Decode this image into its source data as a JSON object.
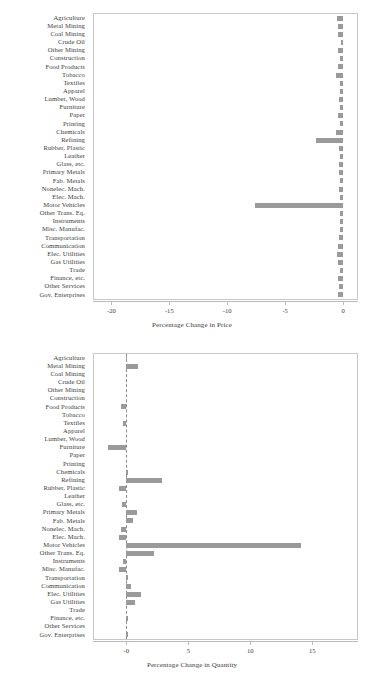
{
  "figure": {
    "panels": [
      {
        "id": "price",
        "axis_title": "Percentage Change in Price"
      },
      {
        "id": "quantity",
        "axis_title": "Percentage Change in Quantity"
      }
    ]
  },
  "categories": [
    "Agriculture",
    "Metal Mining",
    "Coal Mining",
    "Crude Oil",
    "Other Mining",
    "Construction",
    "Food Products",
    "Tobacco",
    "Textiles",
    "Apparel",
    "Lumber, Wood",
    "Furniture",
    "Paper",
    "Printing",
    "Chemicals",
    "Refining",
    "Rubber, Plastic",
    "Leather",
    "Glass, etc.",
    "Primary Metals",
    "Fab. Metals",
    "Nonelec. Mach.",
    "Elec. Mach.",
    "Motor Vehicles",
    "Other Trans. Eq.",
    "Instruments",
    "Misc. Manufac.",
    "Transportation",
    "Communication",
    "Elec. Utilities",
    "Gas Utilities",
    "Trade",
    "Finance, etc.",
    "Other Services",
    "Gov. Enterprises"
  ],
  "colors": {
    "bar": "#9a9a9a",
    "frame": "#c8c8cc",
    "text": "#3c3c3c",
    "zero_line": "#8c8c8c"
  },
  "chart_data": [
    {
      "type": "bar",
      "orientation": "horizontal",
      "id": "price",
      "title": "",
      "xlabel": "Percentage Change in Price",
      "ylabel": "",
      "xlim": [
        -21.5,
        1.2
      ],
      "xticks": [
        -20,
        -15,
        -10,
        -5,
        0
      ],
      "xticklabels": [
        "-20",
        "-15",
        "-10",
        "-5",
        "0"
      ],
      "grid": false,
      "legend": "none",
      "categories": [
        "Agriculture",
        "Metal Mining",
        "Coal Mining",
        "Crude Oil",
        "Other Mining",
        "Construction",
        "Food Products",
        "Tobacco",
        "Textiles",
        "Apparel",
        "Lumber, Wood",
        "Furniture",
        "Paper",
        "Printing",
        "Chemicals",
        "Refining",
        "Rubber, Plastic",
        "Leather",
        "Glass, etc.",
        "Primary Metals",
        "Fab. Metals",
        "Nonelec. Mach.",
        "Elec. Mach.",
        "Motor Vehicles",
        "Other Trans. Eq.",
        "Instruments",
        "Misc. Manufac.",
        "Transportation",
        "Communication",
        "Elec. Utilities",
        "Gas Utilities",
        "Trade",
        "Finance, etc.",
        "Other Services",
        "Gov. Enterprises"
      ],
      "values": [
        -0.55,
        -0.4,
        -0.4,
        -0.22,
        -0.4,
        -0.3,
        -0.45,
        -0.65,
        -0.3,
        -0.28,
        -0.38,
        -0.3,
        -0.4,
        -0.3,
        -0.6,
        -2.35,
        -0.35,
        -0.28,
        -0.35,
        -0.35,
        -0.3,
        -0.32,
        -0.28,
        -7.6,
        -0.28,
        -0.28,
        -0.28,
        -0.38,
        -0.45,
        -0.55,
        -0.45,
        -0.3,
        -0.4,
        -0.35,
        -0.4
      ]
    },
    {
      "type": "bar",
      "orientation": "horizontal",
      "id": "quantity",
      "title": "",
      "xlabel": "Percentage Change in Quantity",
      "ylabel": "",
      "xlim": [
        -2.6,
        18.6
      ],
      "xticks": [
        0,
        5,
        10,
        15
      ],
      "xticklabels": [
        "-0",
        "5",
        "10",
        "15"
      ],
      "grid": false,
      "zero_line": true,
      "legend": "none",
      "categories": [
        "Agriculture",
        "Metal Mining",
        "Coal Mining",
        "Crude Oil",
        "Other Mining",
        "Construction",
        "Food Products",
        "Tobacco",
        "Textiles",
        "Apparel",
        "Lumber, Wood",
        "Furniture",
        "Paper",
        "Printing",
        "Chemicals",
        "Refining",
        "Rubber, Plastic",
        "Leather",
        "Glass, etc.",
        "Primary Metals",
        "Fab. Metals",
        "Nonelec. Mach.",
        "Elec. Mach.",
        "Motor Vehicles",
        "Other Trans. Eq.",
        "Instruments",
        "Misc. Manufac.",
        "Transportation",
        "Communication",
        "Elec. Utilities",
        "Gas Utilities",
        "Trade",
        "Finance, etc.",
        "Other Services",
        "Gov. Enterprises"
      ],
      "values": [
        0.05,
        0.95,
        0.0,
        0.0,
        0.0,
        0.0,
        -0.4,
        0.0,
        -0.3,
        0.0,
        0.0,
        -1.5,
        0.0,
        0.0,
        0.12,
        2.85,
        -0.62,
        0.0,
        -0.35,
        0.9,
        0.55,
        -0.4,
        -0.62,
        14.1,
        2.25,
        -0.3,
        -0.62,
        0.18,
        0.4,
        1.15,
        0.7,
        0.0,
        0.12,
        0.0,
        0.15
      ]
    }
  ]
}
